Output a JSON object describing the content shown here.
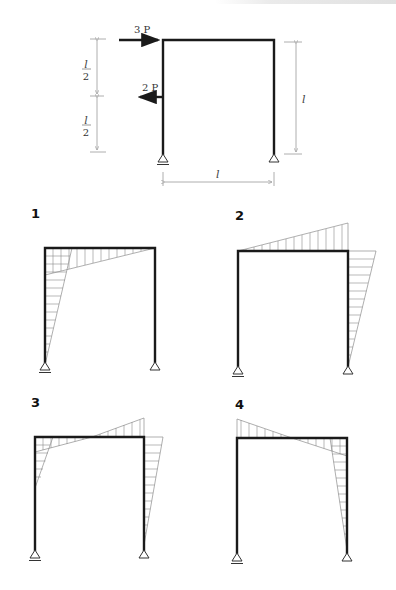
{
  "problem": {
    "loads": [
      {
        "label": "3 P",
        "direction": "right",
        "position": "top of left column"
      },
      {
        "label": "2 P",
        "direction": "left",
        "position": "mid-height of left column"
      }
    ],
    "dimensions": {
      "left_upper": {
        "num": "l",
        "den": "2"
      },
      "left_lower": {
        "num": "l",
        "den": "2"
      },
      "right_height": "l",
      "span": "l"
    },
    "supports": {
      "left": "roller",
      "right": "pin"
    }
  },
  "options": [
    {
      "label": "1"
    },
    {
      "label": "2"
    },
    {
      "label": "3"
    },
    {
      "label": "4"
    }
  ]
}
